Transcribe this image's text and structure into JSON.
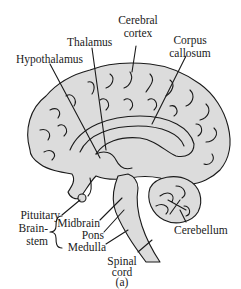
{
  "figure": {
    "panel_label": "(a)",
    "colors": {
      "brain_fill": "#dcdcdc",
      "outline": "#1a1a1a",
      "background": "#ffffff",
      "text": "#1a1a1a"
    },
    "labels": {
      "thalamus": "Thalamus",
      "cerebral_cortex_1": "Cerebral",
      "cerebral_cortex_2": "cortex",
      "corpus_callosum_1": "Corpus",
      "corpus_callosum_2": "callosum",
      "hypothalamus": "Hypothalamus",
      "pituitary": "Pituitary",
      "brainstem_1": "Brain-",
      "brainstem_2": "stem",
      "midbrain": "Midbrain",
      "pons": "Pons",
      "medulla": "Medulla",
      "spinal_cord_1": "Spinal",
      "spinal_cord_2": "cord",
      "cerebellum": "Cerebellum"
    }
  }
}
